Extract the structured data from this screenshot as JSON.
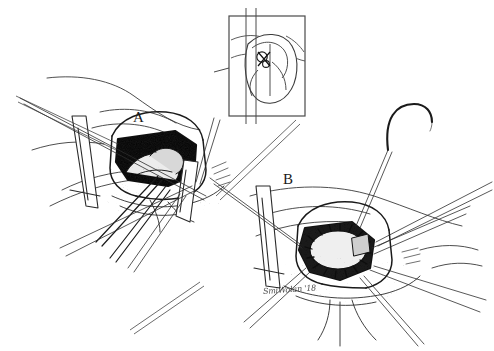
{
  "figure": {
    "width": 494,
    "height": 351,
    "background_color": "#ffffff",
    "ink_color": "#1a1a1a",
    "medium": "pen-and-ink line drawing with stipple shading",
    "panels": [
      {
        "label": "A",
        "caption_text": "A",
        "description": "left-hand operative view: opened chamber held apart by retractor blades with an instrument entering the dark stippled cavity"
      },
      {
        "label": "B",
        "caption_text": "B",
        "description": "right-hand operative view: hexagonal opening ringed with interrupted stay sutures radiating outward"
      }
    ],
    "inset": {
      "present": true,
      "border_color": "#555555",
      "description": "boxed orientation diagram of a heart in cross-section with a small circular marker indicating the incision site"
    },
    "needle": {
      "present": true,
      "description": "curved surgical needle with trailing suture at upper right"
    },
    "signature": {
      "text": "SmiWolan '18",
      "color": "#2b2b2b"
    }
  }
}
